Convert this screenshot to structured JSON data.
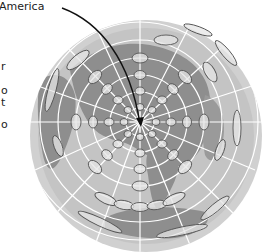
{
  "figure": {
    "label": "America",
    "left_text_fragments": [
      "r",
      "o",
      "t",
      "o"
    ],
    "colors": {
      "ocean": "#c6c6c6",
      "ocean_rim": "#d2d2d2",
      "land": "#8e8e8e",
      "graticule": "#ffffff",
      "ellipse_stroke": "#5a5a5a",
      "ellipse_fill": "#e8e8e8",
      "arrow": "#111111"
    }
  }
}
